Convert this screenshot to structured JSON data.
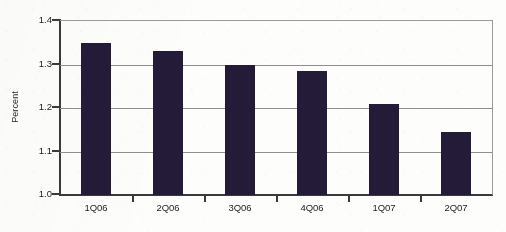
{
  "chart_data": {
    "type": "bar",
    "title": "",
    "subtitle": "",
    "xlabel": "",
    "ylabel": "Percent",
    "categories": [
      "1Q06",
      "2Q06",
      "3Q06",
      "4Q06",
      "1Q07",
      "2Q07"
    ],
    "values": [
      1.35,
      1.33,
      1.3,
      1.285,
      1.21,
      1.145
    ],
    "series": [
      {
        "name": "Percent",
        "values": [
          1.35,
          1.33,
          1.3,
          1.285,
          1.21,
          1.145
        ]
      }
    ],
    "ylim": [
      1.0,
      1.4
    ],
    "ytick_labels": [
      "1.0",
      "1.1",
      "1.2",
      "1.3",
      "1.4"
    ],
    "ytick_values": [
      1.0,
      1.1,
      1.2,
      1.3,
      1.4
    ],
    "grid": true,
    "grid_axis": "y",
    "legend": false,
    "legend_position": "none",
    "annotations": [],
    "colors": {
      "bar": "#241b38",
      "gridline": "#8f8f8f",
      "axis": "#3a3a3a",
      "frame": "#9a9a9a",
      "text": "#1c1c1c",
      "background": "#fdfdfc"
    }
  }
}
